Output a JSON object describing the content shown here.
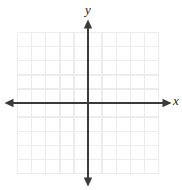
{
  "figure": {
    "name": "cartesian-coordinate-plane",
    "width": 182,
    "height": 190,
    "background_color": "#ffffff"
  },
  "axis_labels": {
    "x": "x",
    "y": "y"
  },
  "chart_data": {
    "type": "scatter",
    "title": "",
    "subtitle": "",
    "xlabel": "x",
    "ylabel": "y",
    "series": [],
    "x": [],
    "y": [],
    "annotations": [],
    "legend": [],
    "legend_position": "none",
    "grid": true,
    "xlim": [
      -5,
      5
    ],
    "ylim": [
      -5,
      5
    ],
    "xticks": [
      -5,
      -4,
      -3,
      -2,
      -1,
      0,
      1,
      2,
      3,
      4,
      5
    ],
    "yticks": [
      -5,
      -4,
      -3,
      -2,
      -1,
      0,
      1,
      2,
      3,
      4,
      5
    ],
    "xtick_labels": [],
    "ytick_labels": [],
    "grid_columns": 10,
    "grid_rows": 10,
    "origin_px": [
      88,
      103
    ],
    "cell_size_px": 14.1,
    "colors": {
      "grid": "#ececec",
      "axis": "#3a3a3a",
      "label": "#1a1a1a",
      "background": "#ffffff"
    }
  }
}
